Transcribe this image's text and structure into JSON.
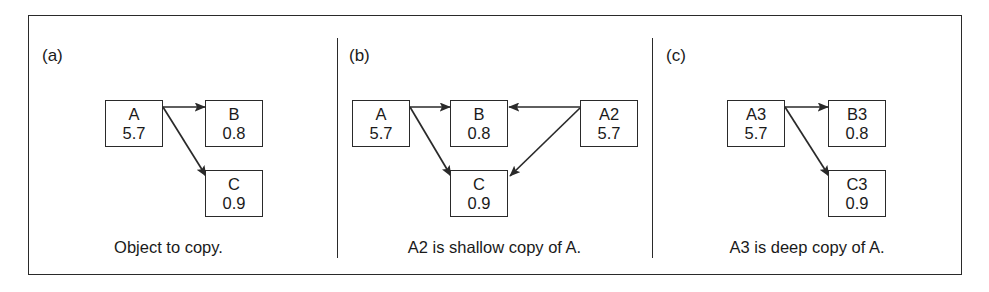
{
  "figure": {
    "panels": [
      {
        "label": "(a)",
        "caption": "Object to copy.",
        "nodes": [
          {
            "name": "A",
            "value": "5.7"
          },
          {
            "name": "B",
            "value": "0.8"
          },
          {
            "name": "C",
            "value": "0.9"
          }
        ],
        "edges": [
          {
            "from": "A",
            "to": "B"
          },
          {
            "from": "A",
            "to": "C"
          }
        ]
      },
      {
        "label": "(b)",
        "caption": "A2 is shallow copy of A.",
        "nodes": [
          {
            "name": "A",
            "value": "5.7"
          },
          {
            "name": "B",
            "value": "0.8"
          },
          {
            "name": "C",
            "value": "0.9"
          },
          {
            "name": "A2",
            "value": "5.7"
          }
        ],
        "edges": [
          {
            "from": "A",
            "to": "B"
          },
          {
            "from": "A",
            "to": "C"
          },
          {
            "from": "A2",
            "to": "B"
          },
          {
            "from": "A2",
            "to": "C"
          }
        ]
      },
      {
        "label": "(c)",
        "caption": "A3 is deep copy of A.",
        "nodes": [
          {
            "name": "A3",
            "value": "5.7"
          },
          {
            "name": "B3",
            "value": "0.8"
          },
          {
            "name": "C3",
            "value": "0.9"
          }
        ],
        "edges": [
          {
            "from": "A3",
            "to": "B3"
          },
          {
            "from": "A3",
            "to": "C3"
          }
        ]
      }
    ],
    "colors": {
      "line": "#2a2a2a",
      "text": "#1a1a1a",
      "background": "#ffffff"
    }
  }
}
